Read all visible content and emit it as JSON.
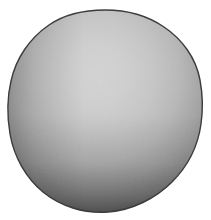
{
  "image": {
    "kind": "natural-image",
    "subject_name": "grayscale-sphere",
    "alt_text": "Photograph of a matte gray sphere on a white background",
    "width": 211,
    "height": 220,
    "background_color": "#ffffff"
  },
  "sphere": {
    "label": "sphere",
    "center_x": 105,
    "center_y": 112,
    "radius_x": 97,
    "radius_y": 101,
    "bounds": {
      "left": 8,
      "top": 10,
      "right": 203,
      "bottom": 213
    },
    "outline_color": "#3c3c3c",
    "shading": {
      "type": "radial-gradient",
      "highlight_x_pct": 46,
      "highlight_y_pct": 34,
      "highlight_color": "#d2d2d2",
      "midtone_color": "#a8a8a8",
      "shadow_color": "#6c6c6c",
      "terminator_color": "#4a4a4a",
      "rim_color": "#343434"
    },
    "bottom_shadow": {
      "color": "#2b2b2b",
      "label": "lower-rim-shadow"
    },
    "texture": {
      "label": "surface-grain",
      "opacity": 0.1
    }
  }
}
